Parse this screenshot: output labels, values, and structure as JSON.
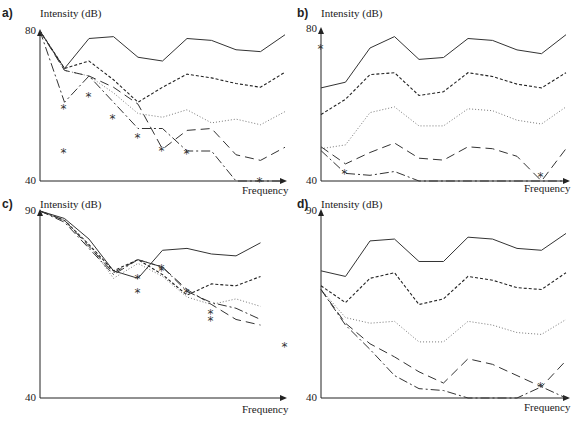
{
  "chart_data": [
    {
      "panel": "a)",
      "type": "line",
      "ylabel": "Intensity (dB)",
      "xlabel": "Frequency",
      "ylim": [
        40,
        80
      ],
      "yticks": [
        "80",
        "40"
      ],
      "x": [
        1,
        2,
        3,
        4,
        5,
        6,
        7,
        8,
        9,
        10,
        11
      ],
      "series": [
        {
          "name": "solid",
          "style": "solid",
          "values": [
            80,
            70,
            78,
            78.5,
            73,
            72,
            78,
            77.5,
            75,
            74.5,
            79
          ]
        },
        {
          "name": "short-dash",
          "style": "short-dash",
          "values": [
            80,
            70,
            72,
            67,
            61,
            65,
            68.5,
            67.5,
            66,
            65,
            69
          ]
        },
        {
          "name": "dotted",
          "style": "dotted",
          "values": [
            80,
            69.5,
            68,
            63.5,
            58,
            57,
            59,
            55.5,
            56.5,
            55,
            58.5
          ]
        },
        {
          "name": "long-dash-star",
          "style": "long-dash",
          "marker": "*",
          "values": [
            80,
            69.5,
            68,
            65,
            60.5,
            48.5,
            53.5,
            54,
            47,
            45.5,
            49
          ]
        },
        {
          "name": "dash-dot-star",
          "style": "dash-dot",
          "marker": "*",
          "values": [
            80,
            61,
            68,
            61,
            54,
            54,
            48,
            48,
            40,
            36,
            39.5
          ]
        }
      ]
    },
    {
      "panel": "b)",
      "type": "line",
      "ylabel": "Intensity (dB)",
      "xlabel": "Frequency",
      "ylim": [
        40,
        80
      ],
      "yticks": [
        "80",
        "40"
      ],
      "x": [
        1,
        2,
        3,
        4,
        5,
        6,
        7,
        8,
        9,
        10,
        11
      ],
      "series": [
        {
          "name": "solid",
          "style": "solid",
          "values": [
            64.5,
            66,
            75,
            78,
            72,
            72.5,
            77.5,
            77,
            74.5,
            73.5,
            78.5
          ]
        },
        {
          "name": "short-dash",
          "style": "short-dash",
          "values": [
            57.5,
            61.5,
            68,
            68.5,
            62.5,
            63.5,
            68.5,
            67.5,
            65.5,
            64.5,
            68.5
          ]
        },
        {
          "name": "dotted",
          "style": "dotted",
          "values": [
            48.5,
            49.5,
            58,
            59.5,
            54.5,
            54.5,
            59,
            58.5,
            56,
            55,
            59.5
          ]
        },
        {
          "name": "long-dash",
          "style": "long-dash",
          "marker": "*",
          "values": [
            49,
            44.5,
            47.5,
            50,
            46,
            45.5,
            49,
            48.5,
            46.5,
            40,
            48.5
          ]
        },
        {
          "name": "dash-dot-star",
          "style": "dash-dot",
          "marker": "*",
          "values": [
            48,
            42,
            41.5,
            42.5,
            40,
            38,
            37,
            36,
            35,
            40,
            38
          ]
        }
      ]
    },
    {
      "panel": "c)",
      "type": "line",
      "ylabel": "Intensity (dB)",
      "xlabel": "Frequency",
      "ylim": [
        40,
        90
      ],
      "yticks": [
        "90",
        "40"
      ],
      "x": [
        1,
        2,
        3,
        4,
        5,
        6,
        7,
        8,
        9,
        10,
        11
      ],
      "series": [
        {
          "name": "solid",
          "style": "solid",
          "values": [
            90,
            88,
            82.5,
            74,
            72,
            79.5,
            80,
            78.5,
            78,
            81.5,
            null
          ]
        },
        {
          "name": "short-dash",
          "style": "short-dash",
          "values": [
            90,
            87.5,
            81,
            74,
            77,
            73,
            67.5,
            70.5,
            70,
            72.5,
            null
          ]
        },
        {
          "name": "dotted",
          "style": "dotted",
          "values": [
            90,
            87.5,
            81,
            72,
            76,
            72.5,
            67,
            65,
            66.5,
            64.5,
            null
          ]
        },
        {
          "name": "long-dash",
          "style": "long-dash",
          "marker": "*",
          "values": [
            90,
            87.5,
            80.5,
            73.5,
            77,
            75,
            69,
            65,
            61,
            59.5,
            null
          ]
        },
        {
          "name": "dash-dot-star",
          "style": "dash-dot",
          "marker": "*",
          "values": [
            90,
            87,
            80,
            73,
            77,
            75,
            68.5,
            65.5,
            64,
            61,
            null
          ]
        }
      ]
    },
    {
      "panel": "d)",
      "type": "line",
      "ylabel": "Intensity (dB)",
      "xlabel": "Frequency",
      "ylim": [
        40,
        90
      ],
      "yticks": [
        "90",
        "40"
      ],
      "x": [
        1,
        2,
        3,
        4,
        5,
        6,
        7,
        8,
        9,
        10,
        11
      ],
      "series": [
        {
          "name": "solid",
          "style": "solid",
          "values": [
            74,
            72.5,
            82,
            82.5,
            76.5,
            76.5,
            83,
            82.5,
            80,
            79.5,
            84
          ]
        },
        {
          "name": "short-dash",
          "style": "short-dash",
          "values": [
            70,
            65.5,
            72,
            73.5,
            65,
            66.5,
            72.5,
            71.5,
            69.5,
            69,
            73.5
          ]
        },
        {
          "name": "dotted",
          "style": "dotted",
          "values": [
            69,
            61.5,
            60,
            60.5,
            55,
            55,
            60.5,
            59.5,
            57.5,
            57,
            61
          ]
        },
        {
          "name": "long-dash",
          "style": "long-dash",
          "marker": "*",
          "values": [
            69,
            60,
            54.5,
            51,
            47,
            44,
            50.5,
            49,
            46,
            43,
            50
          ]
        },
        {
          "name": "dash-dot-star",
          "style": "dash-dot",
          "marker": "*",
          "values": [
            69,
            59.5,
            53,
            46,
            42.5,
            42,
            39,
            37,
            36,
            43,
            40
          ]
        }
      ]
    }
  ],
  "labels": {
    "a": {
      "panel": "a)",
      "ylabel": "Intensity (dB)",
      "ytop": "80",
      "ybottom": "40",
      "xlabel": "Frequency"
    },
    "b": {
      "panel": "b)",
      "ylabel": "Intensity (dB)",
      "ytop": "80",
      "ybottom": "40",
      "xlabel": "Frequency"
    },
    "c": {
      "panel": "c)",
      "ylabel": "Intensity (dB)",
      "ytop": "90",
      "ybottom": "40",
      "xlabel": "Frequency"
    },
    "d": {
      "panel": "d)",
      "ylabel": "Intensity (dB)",
      "ytop": "90",
      "ybottom": "40",
      "xlabel": "Frequency"
    }
  }
}
